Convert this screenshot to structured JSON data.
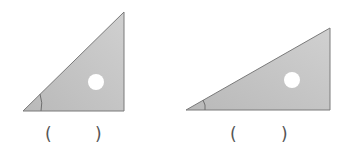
{
  "figure": {
    "colors": {
      "fill": "#b9b9b9",
      "fill_light": "#d0d0d0",
      "edge": "#7a7a7a",
      "hole": "#ffffff",
      "angle_arc": "#6e6e6e",
      "paren": "#555555"
    },
    "triangles": [
      {
        "id": "left",
        "kind": "set-square",
        "marked_angle": "bottom-left acute angle",
        "answer_open": "(",
        "answer_close": ")",
        "answer_value": ""
      },
      {
        "id": "right",
        "kind": "set-square",
        "marked_angle": "bottom-left acute angle",
        "answer_open": "(",
        "answer_close": ")",
        "answer_value": ""
      }
    ]
  }
}
